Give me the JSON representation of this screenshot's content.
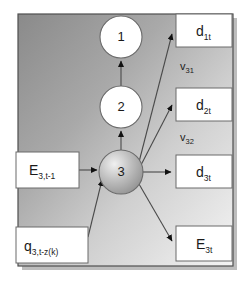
{
  "diagram": {
    "type": "node-link-graph",
    "panel": {
      "background_gradient_from": "#8e8e8e",
      "background_gradient_to": "#f2f2f2",
      "border_color": "#555555",
      "shadow_color": "#b8b8b8"
    },
    "nodes": [
      {
        "id": "node-1",
        "label": "1",
        "cx": 121,
        "cy": 37,
        "r": 21,
        "fill": "#ffffff"
      },
      {
        "id": "node-2",
        "label": "2",
        "cx": 121,
        "cy": 107,
        "r": 21,
        "fill": "#ffffff"
      },
      {
        "id": "node-3",
        "label": "3",
        "cx": 121,
        "cy": 172,
        "r": 22,
        "fill": "#b0b0b0"
      }
    ],
    "boxes": [
      {
        "id": "box-d1t",
        "main": "d",
        "sub": "1t",
        "x": 176,
        "y": 14,
        "w": 56,
        "h": 33,
        "side": "right"
      },
      {
        "id": "box-d2t",
        "main": "d",
        "sub": "2t",
        "x": 176,
        "y": 88,
        "w": 56,
        "h": 33,
        "side": "right"
      },
      {
        "id": "box-d3t",
        "main": "d",
        "sub": "3t",
        "x": 176,
        "y": 155,
        "w": 56,
        "h": 33,
        "side": "right"
      },
      {
        "id": "box-E3t",
        "main": "E",
        "sub": "3t",
        "x": 176,
        "y": 226,
        "w": 56,
        "h": 35,
        "side": "right"
      },
      {
        "id": "box-E3tm1",
        "main": "E",
        "sub": "3,t-1",
        "x": 16,
        "y": 152,
        "w": 63,
        "h": 36,
        "side": "left"
      },
      {
        "id": "box-q3",
        "main": "q",
        "sub": "3,t-z(k)",
        "x": 16,
        "y": 227,
        "w": 72,
        "h": 36,
        "side": "left"
      }
    ],
    "edge_labels": [
      {
        "id": "edge-label-v31",
        "main": "v",
        "sub": "31",
        "x": 180,
        "y": 70
      },
      {
        "id": "edge-label-v32",
        "main": "v",
        "sub": "32",
        "x": 180,
        "y": 141
      }
    ],
    "edges": [
      {
        "id": "edge-3-to-2",
        "from": "node-3",
        "to": "node-2",
        "direction": "up"
      },
      {
        "id": "edge-2-to-1",
        "from": "node-2",
        "to": "node-1",
        "direction": "up"
      },
      {
        "id": "edge-3-to-d1t",
        "from": "node-3",
        "to": "box-d1t",
        "direction": "out"
      },
      {
        "id": "edge-3-to-d2t",
        "from": "node-3",
        "to": "box-d2t",
        "direction": "out"
      },
      {
        "id": "edge-3-to-d3t",
        "from": "node-3",
        "to": "box-d3t",
        "direction": "out"
      },
      {
        "id": "edge-3-to-E3t",
        "from": "node-3",
        "to": "box-E3t",
        "direction": "out"
      },
      {
        "id": "edge-E3tm1-to-3",
        "from": "box-E3tm1",
        "to": "node-3",
        "direction": "in"
      },
      {
        "id": "edge-q3-to-3",
        "from": "box-q3",
        "to": "node-3",
        "direction": "in"
      }
    ]
  }
}
